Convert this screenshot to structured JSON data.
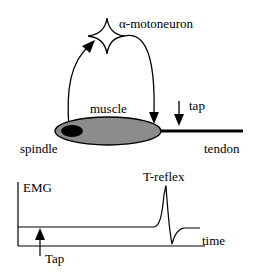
{
  "diagram": {
    "labels": {
      "neuron": "α-motoneuron",
      "muscle": "muscle",
      "spindle": "spindle",
      "tendon": "tendon",
      "tap_top": "tap",
      "emg": "EMG",
      "reflex": "T-reflex",
      "time": "time",
      "tap_bottom": "Tap"
    },
    "colors": {
      "muscle_fill": "#8c8c8c",
      "line": "#000000"
    }
  }
}
